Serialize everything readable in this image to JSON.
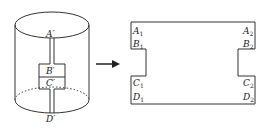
{
  "diagram": {
    "type": "cylinder-unrolling",
    "left_figure": {
      "shape": "cylinder",
      "labels": {
        "a": "A′",
        "b": "B′",
        "c": "C′",
        "d": "D′"
      }
    },
    "arrow": {
      "direction": "right"
    },
    "right_figure": {
      "shape": "unrolled-net",
      "labels": {
        "a1": "A",
        "a1_sub": "1",
        "a2": "A",
        "a2_sub": "2",
        "b1": "B",
        "b1_sub": "1",
        "b2": "B",
        "b2_sub": "2",
        "c1": "C",
        "c1_sub": "1",
        "c2": "C",
        "c2_sub": "2",
        "d1": "D",
        "d1_sub": "1",
        "d2": "D",
        "d2_sub": "2"
      }
    },
    "colors": {
      "stroke": "#333333",
      "background": "#ffffff"
    }
  }
}
